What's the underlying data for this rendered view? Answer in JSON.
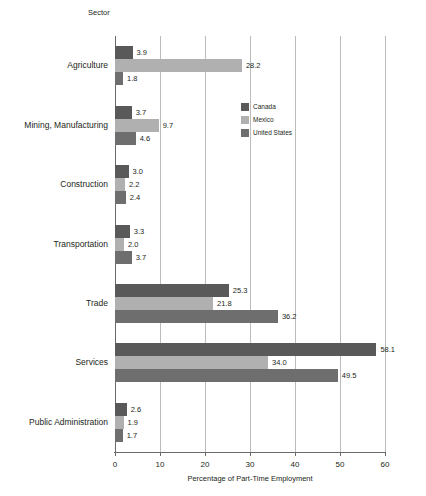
{
  "chart_data": {
    "type": "bar",
    "orientation": "horizontal",
    "title": "",
    "xlabel": "Percentage of Part-Time Employment",
    "ylabel": "Sector",
    "xlim": [
      0,
      60
    ],
    "xticks": [
      0,
      10,
      20,
      30,
      40,
      50,
      60
    ],
    "xticklabels": [
      "0",
      "10",
      "20",
      "30",
      "40",
      "50",
      "60"
    ],
    "grid": "vertical",
    "legend_position": "upper-center-inside",
    "categories": [
      "Agriculture",
      "Mining, Manufacturing",
      "Construction",
      "Transportation",
      "Trade",
      "Services",
      "Public Administration"
    ],
    "series": [
      {
        "name": "Canada",
        "color": "#595959",
        "values": [
          3.9,
          3.7,
          3.0,
          3.3,
          25.3,
          58.1,
          2.6
        ],
        "labels": [
          "3.9",
          "3.7",
          "3.0",
          "3.3",
          "25.3",
          "58.1",
          "2.6"
        ]
      },
      {
        "name": "Mexico",
        "color": "#b0b0b0",
        "values": [
          28.2,
          9.7,
          2.2,
          2.0,
          21.8,
          34.0,
          1.9
        ],
        "labels": [
          "28.2",
          "9.7",
          "2.2",
          "2.0",
          "21.8",
          "34.0",
          "1.9"
        ]
      },
      {
        "name": "United States",
        "color": "#6e6e6e",
        "values": [
          1.8,
          4.6,
          2.4,
          3.7,
          36.2,
          49.5,
          1.7
        ],
        "labels": [
          "1.8",
          "4.6",
          "2.4",
          "3.7",
          "36.2",
          "49.5",
          "1.7"
        ]
      }
    ]
  },
  "legend": {
    "items": [
      {
        "label": "Canada",
        "color": "#595959"
      },
      {
        "label": "Mexico",
        "color": "#b0b0b0"
      },
      {
        "label": "United States",
        "color": "#6e6e6e"
      }
    ]
  }
}
